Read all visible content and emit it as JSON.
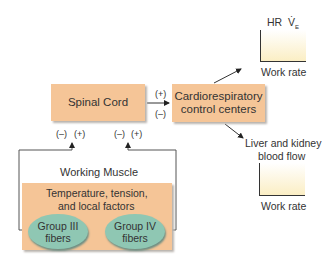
{
  "diagram": {
    "spinal_cord": {
      "label": "Spinal Cord"
    },
    "cardio_centers": {
      "label_line1": "Cardiorespiratory",
      "label_line2": "control centers"
    },
    "spinal_to_cardio": {
      "plus": "(+)",
      "minus": "(–)"
    },
    "top_graph": {
      "y_label_hr": "HR",
      "y_label_ve": "V̇",
      "y_label_ve_sub": "E",
      "x_label": "Work rate",
      "trend": "increasing"
    },
    "bottom_graph": {
      "title_line1": "Liver and kidney",
      "title_line2": "blood flow",
      "x_label": "Work rate",
      "trend": "decreasing"
    },
    "feedback_left": {
      "minus": "(–)",
      "plus": "(+)"
    },
    "feedback_right": {
      "minus": "(–)",
      "plus": "(+)"
    },
    "working_muscle": {
      "title": "Working Muscle",
      "factors_line1": "Temperature, tension,",
      "factors_line2": "and local factors",
      "group3_line1": "Group III",
      "group3_line2": "fibers",
      "group4_line1": "Group IV",
      "group4_line2": "fibers"
    },
    "colors": {
      "box_fill": "#f5c597",
      "ellipse_fill": "#8fc7b3",
      "graph_fill": "#fbeec4",
      "line": "#333333"
    }
  }
}
